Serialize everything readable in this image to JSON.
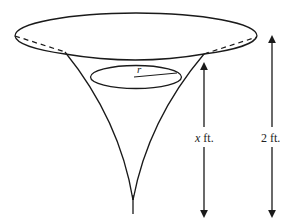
{
  "diagram": {
    "type": "funnel-shaped solid of revolution with inner cross-section",
    "labels": {
      "radius": "r",
      "inner_height_var": "x",
      "inner_height_unit": "ft.",
      "total_height": "2 ft."
    },
    "colors": {
      "stroke": "#1a1a1a",
      "background": "#ffffff"
    }
  }
}
